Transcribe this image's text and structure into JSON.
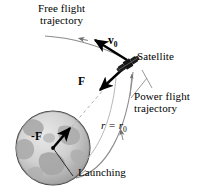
{
  "figure": {
    "type": "physics-diagram",
    "background_color": "#ffffff",
    "ink_color": "#000000",
    "guide_color": "#9a9a9a"
  },
  "labels": {
    "free_flight_line1": "Free flight",
    "free_flight_line2": "trajectory",
    "satellite": "Satellite",
    "velocity_symbol": "v",
    "velocity_subscript": "0",
    "force_symbol": "F",
    "reaction_force_symbol": "-F",
    "power_flight_line1": "Power flight",
    "power_flight_line2": "trajectory",
    "radius_expr_lhs": "r",
    "radius_expr_eq": " = ",
    "radius_expr_rhs": "r",
    "radius_subscript": "0",
    "launching": "Launching"
  },
  "earth": {
    "name": "earth-sphere",
    "center_x": 53,
    "center_y": 148,
    "radius": 37,
    "fill_color": "#d2d2d2",
    "edge_color": "#808080",
    "continent_color": "#a8a8a8",
    "outline_color": "#4a4a4a"
  },
  "satellite_body": {
    "name": "satellite-icon",
    "x": 123,
    "y": 62,
    "color": "#111111"
  },
  "vectors": [
    {
      "name": "velocity-vector-v0",
      "label": "v0",
      "from_x": 127,
      "from_y": 60,
      "to_x": 92,
      "to_y": 38,
      "style": "bold-solid-arrow"
    },
    {
      "name": "gravity-force-vector-F",
      "label": "F",
      "from_x": 126,
      "from_y": 66,
      "to_x": 98,
      "to_y": 92,
      "style": "bold-solid-arrow"
    },
    {
      "name": "reaction-force-vector-negF",
      "label": "-F",
      "from_x": 53,
      "from_y": 148,
      "to_x": 72,
      "to_y": 126,
      "style": "bold-solid-arrow"
    }
  ],
  "curves": [
    {
      "name": "free-flight-trajectory-curve",
      "style": "solid-thin-gray",
      "arrow": "mid-curve-leftward"
    },
    {
      "name": "power-flight-trajectory-curve",
      "style": "solid-thin-gray",
      "arrow": "mid-curve-upward"
    },
    {
      "name": "radius-dashed-line",
      "style": "dashed-thin-gray",
      "from": "earth-center",
      "to": "satellite"
    },
    {
      "name": "launch-radius-line",
      "style": "solid-thin-dark",
      "from": "earth-center",
      "to": "launch-point"
    }
  ],
  "leaders": [
    {
      "name": "satellite-leader-line",
      "style": "thin-gray-arrow"
    },
    {
      "name": "power-flight-leader-line",
      "style": "thin-gray"
    },
    {
      "name": "launching-leader-line",
      "style": "thin-gray"
    }
  ]
}
